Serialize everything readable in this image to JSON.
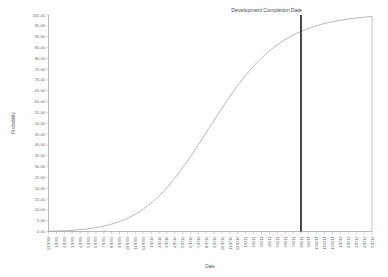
{
  "chart_data": {
    "type": "line",
    "title": "",
    "xlabel": "Date",
    "ylabel": "Probability",
    "ylim": [
      0,
      100
    ],
    "grid": false,
    "legend": null,
    "ytick_labels": [
      "100.00",
      "95.00",
      "90.00",
      "85.00",
      "80.00",
      "75.00",
      "70.00",
      "65.00",
      "60.00",
      "55.00",
      "50.00",
      "45.00",
      "40.00",
      "35.00",
      "30.00",
      "25.00",
      "20.00",
      "15.00",
      "10.00",
      "5.00",
      "0.00"
    ],
    "ytick_values": [
      100,
      95,
      90,
      85,
      80,
      75,
      70,
      65,
      60,
      55,
      50,
      45,
      40,
      35,
      30,
      25,
      20,
      15,
      10,
      5,
      0
    ],
    "categories": [
      "12/1/08",
      "1/1/09",
      "2/1/09",
      "3/1/09",
      "4/1/09",
      "5/1/09",
      "6/1/09",
      "7/1/09",
      "8/1/09",
      "9/1/09",
      "10/1/09",
      "11/1/09",
      "12/1/09",
      "1/1/10",
      "2/1/10",
      "3/1/10",
      "4/1/10",
      "5/1/10",
      "6/1/10",
      "7/1/10",
      "8/1/10",
      "9/1/10",
      "10/1/10",
      "11/1/10",
      "12/1/10",
      "1/1/11",
      "2/1/11",
      "3/1/11",
      "4/1/11",
      "5/1/11",
      "6/1/11",
      "7/1/11",
      "8/1/11",
      "9/1/11",
      "10/1/11",
      "11/1/11",
      "12/1/11",
      "1/1/12",
      "2/1/12",
      "3/1/12",
      "4/1/12",
      "5/1/12"
    ],
    "series": [
      {
        "name": "Cumulative Probability",
        "values": [
          0.1,
          0.2,
          0.35,
          0.55,
          0.85,
          1.25,
          1.8,
          2.5,
          3.4,
          4.6,
          6.1,
          8.0,
          10.3,
          13.1,
          16.4,
          20.2,
          24.6,
          29.4,
          34.6,
          40.1,
          45.8,
          51.5,
          57.1,
          62.5,
          67.6,
          72.2,
          76.4,
          80.1,
          83.4,
          86.2,
          88.6,
          90.7,
          92.4,
          93.9,
          95.1,
          96.1,
          96.9,
          97.6,
          98.1,
          98.6,
          99.0,
          99.4
        ]
      }
    ],
    "annotations": [
      {
        "label": "Development Completion Date",
        "type": "vertical-line",
        "x_category": "8/1/11",
        "y_intersect": 82.0
      }
    ]
  },
  "axis": {
    "y_title": "Probability",
    "x_title": "Date"
  },
  "colors": {
    "curve": "#9b9b9b",
    "marker": "#1a1a1a",
    "axis": "#8a8a8a",
    "text": "#6b6b6b",
    "background": "#ffffff"
  }
}
